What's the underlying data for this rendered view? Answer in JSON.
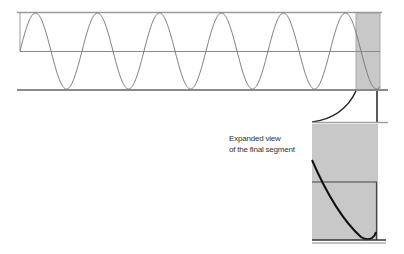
{
  "caption": {
    "line1": "Expanded view",
    "line2": "of the final segment"
  },
  "colors": {
    "frame_line": "#9a9a9a",
    "wave": "#7a7a7a",
    "highlight_fill": "#c8c8c8",
    "highlight_edge": "#a8a8a8",
    "expanded_curve": "#111111",
    "connector": "#222222"
  },
  "main_plot": {
    "x_start": 20,
    "x_end": 380,
    "y_top": 12,
    "y_mid": 51,
    "y_bottom": 90,
    "period_px": 62,
    "cycles_visible": 5.75,
    "highlight_segment": {
      "x_start": 356,
      "x_end": 380
    }
  },
  "expanded_view": {
    "x_start": 312,
    "x_end": 377,
    "y_top": 122,
    "y_mid": 182,
    "y_bottom": 240
  }
}
